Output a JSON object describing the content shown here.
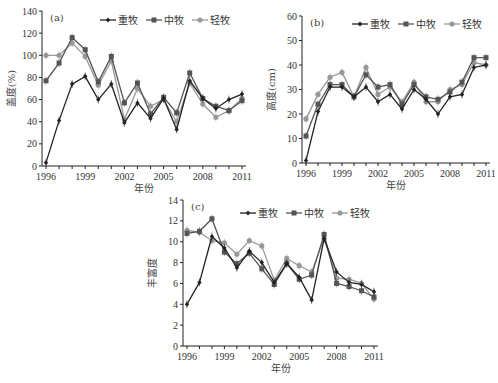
{
  "colors": {
    "heavy": "#222222",
    "medium": "#555555",
    "light": "#999999",
    "axis": "#222222"
  },
  "legend": [
    "重牧",
    "中牧",
    "轻牧"
  ],
  "chart_data": [
    {
      "type": "line",
      "panel": "(a)",
      "title": "",
      "xlabel": "年份",
      "ylabel": "盖度(%)",
      "ylim": [
        0,
        140
      ],
      "yticks": [
        0,
        20,
        40,
        60,
        80,
        100,
        120,
        140
      ],
      "xticks": [
        "1996",
        "1999",
        "2002",
        "2005",
        "2008",
        "2011"
      ],
      "x": [
        1996,
        1997,
        1998,
        1999,
        2000,
        2001,
        2002,
        2003,
        2004,
        2005,
        2006,
        2007,
        2008,
        2009,
        2010,
        2011
      ],
      "series": [
        {
          "name": "重牧",
          "values": [
            3,
            41,
            74,
            81,
            60,
            74,
            39,
            57,
            43,
            61,
            33,
            77,
            61,
            52,
            60,
            65
          ]
        },
        {
          "name": "中牧",
          "values": [
            77,
            93,
            116,
            105,
            76,
            99,
            57,
            75,
            47,
            62,
            48,
            84,
            61,
            54,
            50,
            59
          ]
        },
        {
          "name": "轻牧",
          "values": [
            100,
            100,
            111,
            99,
            73,
            95,
            42,
            70,
            54,
            60,
            40,
            75,
            56,
            44,
            50,
            61
          ]
        }
      ],
      "legend_position": "top-right",
      "grid": false
    },
    {
      "type": "line",
      "panel": "(b)",
      "title": "",
      "xlabel": "年份",
      "ylabel": "高度(cm)",
      "ylim": [
        0,
        60
      ],
      "yticks": [
        0,
        10,
        20,
        30,
        40,
        50,
        60
      ],
      "xticks": [
        "1996",
        "1999",
        "2002",
        "2005",
        "2008",
        "2011"
      ],
      "x": [
        1996,
        1997,
        1998,
        1999,
        2000,
        2001,
        2002,
        2003,
        2004,
        2005,
        2006,
        2007,
        2008,
        2009,
        2010,
        2011
      ],
      "series": [
        {
          "name": "重牧",
          "values": [
            1,
            21,
            31,
            31,
            27,
            31,
            25,
            28,
            22,
            30,
            26,
            20,
            27,
            28,
            39,
            40
          ]
        },
        {
          "name": "中牧",
          "values": [
            11,
            24,
            32,
            32,
            27,
            36,
            31,
            32,
            24,
            32,
            27,
            26,
            29,
            33,
            43,
            43
          ]
        },
        {
          "name": "轻牧",
          "values": [
            18,
            28,
            35,
            37,
            27,
            39,
            28,
            31,
            25,
            33,
            25,
            25,
            30,
            32,
            41,
            40
          ]
        }
      ],
      "legend_position": "top-right",
      "grid": false
    },
    {
      "type": "line",
      "panel": "(c)",
      "title": "",
      "xlabel": "年份",
      "ylabel": "丰富度",
      "ylim": [
        0,
        14
      ],
      "yticks": [
        0,
        2,
        4,
        6,
        8,
        10,
        12,
        14
      ],
      "xticks": [
        "1996",
        "1999",
        "2002",
        "2005",
        "2008",
        "2011"
      ],
      "x": [
        1996,
        1997,
        1998,
        1999,
        2000,
        2001,
        2002,
        2003,
        2004,
        2005,
        2006,
        2007,
        2008,
        2009,
        2010,
        2011
      ],
      "series": [
        {
          "name": "重牧",
          "values": [
            4,
            6.1,
            10.5,
            9.4,
            7.5,
            9.1,
            8,
            6.1,
            7.9,
            6.6,
            4.4,
            10.3,
            7.1,
            6.1,
            5.9,
            5.2
          ]
        },
        {
          "name": "中牧",
          "values": [
            10.8,
            11,
            12.2,
            9,
            7.9,
            8.9,
            7.4,
            5.9,
            7.9,
            6.4,
            6.8,
            10.7,
            6,
            5.7,
            5.3,
            4.7
          ]
        },
        {
          "name": "轻牧",
          "values": [
            11.1,
            10.9,
            10.1,
            9.9,
            8.8,
            10.1,
            9.6,
            6.3,
            8.4,
            7.7,
            7.1,
            10.3,
            6.5,
            6.4,
            6,
            4.5
          ]
        }
      ],
      "legend_position": "top-right",
      "grid": false
    }
  ]
}
